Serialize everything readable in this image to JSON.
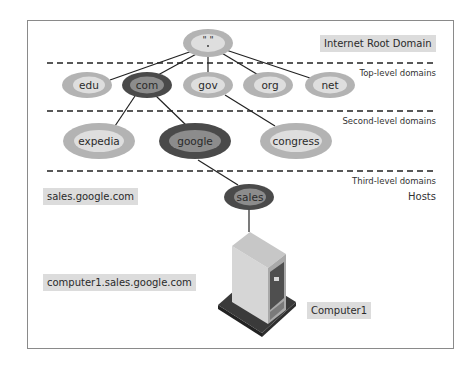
{
  "diagram": {
    "title_tag": "Internet Root Domain",
    "root": {
      "label": "\" \"\n.",
      "display": "\" \""
    },
    "levels": {
      "top": "Top-level domains",
      "second": "Second-level domains",
      "third": "Third-level domains",
      "hosts": "Hosts"
    },
    "top_level_nodes": [
      {
        "label": "edu",
        "highlighted": false
      },
      {
        "label": "com",
        "highlighted": true
      },
      {
        "label": "gov",
        "highlighted": false
      },
      {
        "label": "org",
        "highlighted": false
      },
      {
        "label": "net",
        "highlighted": false
      }
    ],
    "second_level_nodes": [
      {
        "label": "expedia",
        "parent": "com",
        "highlighted": false
      },
      {
        "label": "google",
        "parent": "com",
        "highlighted": true
      },
      {
        "label": "congress",
        "parent": "gov",
        "highlighted": false
      }
    ],
    "third_level_nodes": [
      {
        "label": "sales",
        "parent": "google",
        "highlighted": true
      }
    ],
    "host": {
      "label": "Computer1",
      "parent": "sales",
      "icon": "server-tower-icon"
    },
    "fqdn_tags": {
      "third_level": "sales.google.com",
      "host": "computer1.sales.google.com"
    },
    "colors": {
      "node_outer": "#b3b3b3",
      "node_inner": "#dedede",
      "highlight_outer": "#4a4a4a",
      "highlight_inner": "#8c8c8c",
      "tag_bg": "#dcdcdc",
      "line": "#222222"
    }
  }
}
